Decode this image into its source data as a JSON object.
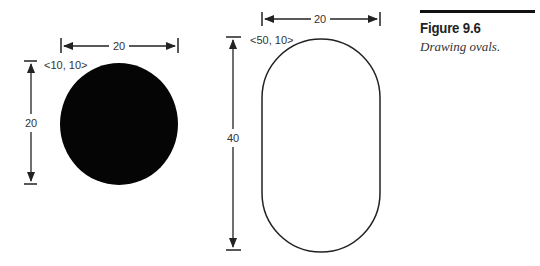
{
  "figure": {
    "title": "Figure 9.6",
    "caption": "Drawing ovals."
  },
  "left_shape": {
    "type": "circle",
    "fill": "#000000",
    "origin_label": "<10, 10>",
    "width_label": "20",
    "height_label": "20"
  },
  "right_shape": {
    "type": "oval",
    "fill": "#ffffff",
    "stroke": "#222222",
    "origin_label": "<50, 10>",
    "width_label": "20",
    "height_label": "40"
  }
}
